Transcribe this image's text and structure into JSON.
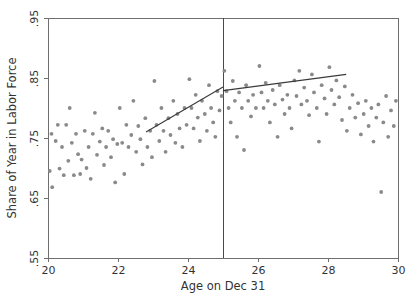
{
  "chart_data": {
    "type": "scatter",
    "title": "",
    "xlabel": "Age on Dec 31",
    "ylabel": "Share of Year in Labor Force",
    "xlim": [
      20,
      30
    ],
    "ylim": [
      0.55,
      0.95
    ],
    "xticks": [
      20,
      22,
      24,
      26,
      28,
      30
    ],
    "xticklabels": [
      "20",
      "22",
      "24",
      "26",
      "28",
      "30"
    ],
    "yticks": [
      0.55,
      0.65,
      0.75,
      0.85,
      0.95
    ],
    "yticklabels": [
      ".55",
      ".65",
      ".75",
      ".85",
      ".95"
    ],
    "grid": false,
    "legend": null,
    "marker_color": "#8a8a8a",
    "line_color": "#3a3a3a",
    "frame_color": "#6f6f6f",
    "annotations": [
      {
        "name": "cutoff-vline",
        "type": "vline",
        "x": 25,
        "color": "#4a4a4a"
      }
    ],
    "series": [
      {
        "name": "observations",
        "type": "scatter",
        "points": [
          [
            20.05,
            0.695
          ],
          [
            20.1,
            0.757
          ],
          [
            20.12,
            0.668
          ],
          [
            20.22,
            0.745
          ],
          [
            20.28,
            0.772
          ],
          [
            20.33,
            0.699
          ],
          [
            20.4,
            0.735
          ],
          [
            20.45,
            0.688
          ],
          [
            20.52,
            0.772
          ],
          [
            20.58,
            0.712
          ],
          [
            20.62,
            0.8
          ],
          [
            20.68,
            0.742
          ],
          [
            20.74,
            0.688
          ],
          [
            20.8,
            0.757
          ],
          [
            20.86,
            0.723
          ],
          [
            20.92,
            0.69
          ],
          [
            20.96,
            0.714
          ],
          [
            21.05,
            0.762
          ],
          [
            21.1,
            0.7
          ],
          [
            21.16,
            0.735
          ],
          [
            21.22,
            0.682
          ],
          [
            21.28,
            0.757
          ],
          [
            21.34,
            0.792
          ],
          [
            21.4,
            0.722
          ],
          [
            21.48,
            0.744
          ],
          [
            21.55,
            0.766
          ],
          [
            21.6,
            0.705
          ],
          [
            21.66,
            0.735
          ],
          [
            21.72,
            0.762
          ],
          [
            21.8,
            0.718
          ],
          [
            21.86,
            0.748
          ],
          [
            21.92,
            0.676
          ],
          [
            21.98,
            0.74
          ],
          [
            22.05,
            0.8
          ],
          [
            22.12,
            0.742
          ],
          [
            22.18,
            0.69
          ],
          [
            22.24,
            0.772
          ],
          [
            22.3,
            0.735
          ],
          [
            22.38,
            0.755
          ],
          [
            22.44,
            0.812
          ],
          [
            22.52,
            0.727
          ],
          [
            22.58,
            0.77
          ],
          [
            22.64,
            0.748
          ],
          [
            22.7,
            0.706
          ],
          [
            22.78,
            0.783
          ],
          [
            22.84,
            0.735
          ],
          [
            22.92,
            0.762
          ],
          [
            22.97,
            0.718
          ],
          [
            23.04,
            0.845
          ],
          [
            23.1,
            0.772
          ],
          [
            23.18,
            0.745
          ],
          [
            23.24,
            0.8
          ],
          [
            23.3,
            0.762
          ],
          [
            23.36,
            0.727
          ],
          [
            23.44,
            0.783
          ],
          [
            23.5,
            0.755
          ],
          [
            23.58,
            0.812
          ],
          [
            23.64,
            0.742
          ],
          [
            23.7,
            0.79
          ],
          [
            23.76,
            0.766
          ],
          [
            23.84,
            0.735
          ],
          [
            23.9,
            0.8
          ],
          [
            23.96,
            0.772
          ],
          [
            24.04,
            0.848
          ],
          [
            24.1,
            0.8
          ],
          [
            24.16,
            0.766
          ],
          [
            24.22,
            0.822
          ],
          [
            24.28,
            0.784
          ],
          [
            24.34,
            0.745
          ],
          [
            24.4,
            0.812
          ],
          [
            24.48,
            0.79
          ],
          [
            24.54,
            0.762
          ],
          [
            24.6,
            0.838
          ],
          [
            24.66,
            0.8
          ],
          [
            24.72,
            0.776
          ],
          [
            24.78,
            0.752
          ],
          [
            24.84,
            0.828
          ],
          [
            24.9,
            0.796
          ],
          [
            24.96,
            0.82
          ],
          [
            25.04,
            0.862
          ],
          [
            25.1,
            0.828
          ],
          [
            25.16,
            0.8
          ],
          [
            25.22,
            0.776
          ],
          [
            25.28,
            0.845
          ],
          [
            25.34,
            0.812
          ],
          [
            25.4,
            0.752
          ],
          [
            25.46,
            0.826
          ],
          [
            25.54,
            0.8
          ],
          [
            25.6,
            0.73
          ],
          [
            25.66,
            0.838
          ],
          [
            25.72,
            0.812
          ],
          [
            25.8,
            0.786
          ],
          [
            25.86,
            0.822
          ],
          [
            25.94,
            0.8
          ],
          [
            26.04,
            0.87
          ],
          [
            26.1,
            0.826
          ],
          [
            26.16,
            0.8
          ],
          [
            26.22,
            0.842
          ],
          [
            26.28,
            0.812
          ],
          [
            26.34,
            0.776
          ],
          [
            26.42,
            0.83
          ],
          [
            26.48,
            0.806
          ],
          [
            26.56,
            0.752
          ],
          [
            26.62,
            0.838
          ],
          [
            26.7,
            0.814
          ],
          [
            26.76,
            0.79
          ],
          [
            26.84,
            0.822
          ],
          [
            26.9,
            0.8
          ],
          [
            26.96,
            0.766
          ],
          [
            27.04,
            0.846
          ],
          [
            27.1,
            0.82
          ],
          [
            27.18,
            0.862
          ],
          [
            27.24,
            0.806
          ],
          [
            27.32,
            0.834
          ],
          [
            27.4,
            0.812
          ],
          [
            27.46,
            0.788
          ],
          [
            27.54,
            0.856
          ],
          [
            27.6,
            0.826
          ],
          [
            27.68,
            0.8
          ],
          [
            27.74,
            0.744
          ],
          [
            27.82,
            0.838
          ],
          [
            27.9,
            0.816
          ],
          [
            27.96,
            0.79
          ],
          [
            28.04,
            0.868
          ],
          [
            28.1,
            0.83
          ],
          [
            28.18,
            0.806
          ],
          [
            28.24,
            0.846
          ],
          [
            28.32,
            0.818
          ],
          [
            28.4,
            0.78
          ],
          [
            28.48,
            0.836
          ],
          [
            28.54,
            0.762
          ],
          [
            28.62,
            0.8
          ],
          [
            28.7,
            0.822
          ],
          [
            28.78,
            0.784
          ],
          [
            28.86,
            0.808
          ],
          [
            28.94,
            0.756
          ],
          [
            29.02,
            0.79
          ],
          [
            29.08,
            0.812
          ],
          [
            29.16,
            0.77
          ],
          [
            29.24,
            0.8
          ],
          [
            29.3,
            0.744
          ],
          [
            29.38,
            0.784
          ],
          [
            29.44,
            0.806
          ],
          [
            29.52,
            0.66
          ],
          [
            29.58,
            0.776
          ],
          [
            29.66,
            0.82
          ],
          [
            29.72,
            0.752
          ],
          [
            29.8,
            0.796
          ],
          [
            29.88,
            0.77
          ],
          [
            29.94,
            0.812
          ]
        ]
      },
      {
        "name": "fit-left",
        "type": "line",
        "points": [
          [
            22.8,
            0.76
          ],
          [
            25.0,
            0.835
          ]
        ]
      },
      {
        "name": "fit-right",
        "type": "line",
        "points": [
          [
            25.0,
            0.829
          ],
          [
            28.52,
            0.856
          ]
        ]
      }
    ]
  }
}
